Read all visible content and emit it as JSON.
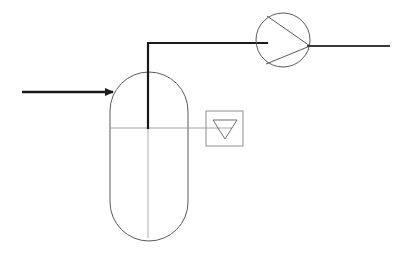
{
  "document": {
    "title": "Process Flow Diagram",
    "type": "piping-and-instrumentation-diagram",
    "canvas": {
      "width": 403,
      "height": 261
    },
    "background_color": "#ffffff"
  },
  "style": {
    "pipe_color": "#1a1a1a",
    "equipment_outline_color": "#5a5a5a",
    "light_line_color": "#9a9a9a",
    "instrument_outline_color": "#8d8d8d",
    "pipe_width": 2.2,
    "equipment_width": 1.0,
    "light_width": 0.8
  },
  "equipment": {
    "vessel": {
      "name": "vertical-vessel",
      "symbol": "capsule",
      "label": "",
      "geometry": {
        "left": 110,
        "right": 188,
        "top": 72,
        "bottom": 241,
        "corner_radius": 39,
        "center_x": 149
      },
      "liquid_level": {
        "label": "",
        "y": 128,
        "line_from_x": 110,
        "line_to_x": 232
      },
      "centerline": {
        "x": 148,
        "from_y": 128,
        "to_y": 238
      }
    },
    "pump": {
      "name": "centrifugal-pump",
      "symbol": "circle-with-triangle",
      "label": "",
      "geometry": {
        "center_x": 283,
        "center_y": 40,
        "radius": 27
      },
      "impeller_triangle": {
        "apex": [
          310,
          46
        ],
        "base_top": [
          267,
          16
        ],
        "base_bottom": [
          266,
          64
        ]
      }
    }
  },
  "instruments": {
    "level_indicator": {
      "name": "level-indicator",
      "symbol": "box-with-down-triangle",
      "tag": "",
      "geometry": {
        "left": 206,
        "top": 111,
        "width": 37,
        "height": 35
      },
      "triangle": {
        "left": [
          213,
          120
        ],
        "right": [
          237,
          120
        ],
        "apex": [
          225,
          139
        ]
      }
    }
  },
  "streams": {
    "feed_inlet": {
      "name": "feed-inlet-stream",
      "label": "",
      "direction": "right",
      "from": [
        22,
        92
      ],
      "to": [
        120,
        92
      ],
      "arrowhead": true
    },
    "vessel_overhead": {
      "name": "overhead-vapor-line",
      "label": "",
      "segments": [
        {
          "from": [
            148,
            128
          ],
          "to": [
            148,
            43
          ]
        },
        {
          "from": [
            148,
            43
          ],
          "to": [
            266,
            43
          ]
        }
      ]
    },
    "pump_discharge": {
      "name": "pump-discharge-stream",
      "label": "",
      "direction": "right",
      "from": [
        309,
        46
      ],
      "to": [
        390,
        46
      ],
      "arrowhead": false
    }
  }
}
